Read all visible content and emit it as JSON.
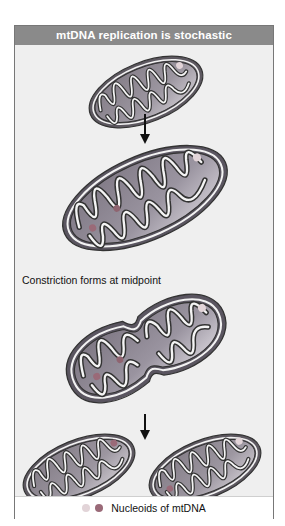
{
  "figure": {
    "title": "mtDNA replication is stochastic",
    "steps": [
      {
        "id": "parent",
        "label": ""
      },
      {
        "id": "grown",
        "label": ""
      },
      {
        "id": "constricted",
        "label": "Constriction forms at midpoint"
      },
      {
        "id": "daughters",
        "label": ""
      }
    ],
    "legend": {
      "label": "Nucleoids of mtDNA",
      "swatches": [
        {
          "name": "light-nucleoid",
          "color": "#e2d4d8"
        },
        {
          "name": "dark-nucleoid",
          "color": "#9a6a78"
        }
      ]
    },
    "colors": {
      "header": "#8a8a8a",
      "frame_bg": "#efefef",
      "matrix": "#8d8690",
      "matrix_light": "#c9c4cb",
      "membrane_dark": "#3a3a3a",
      "membrane_light": "#f4f4f4"
    }
  }
}
